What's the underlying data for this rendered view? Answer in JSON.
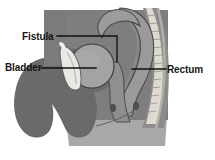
{
  "figure": {
    "background_color": "#ffffff",
    "width": 215,
    "height": 160
  },
  "labels": {
    "fistula": "Fistula",
    "bladder": "Bladder",
    "rectum": "Rectum"
  },
  "colors": {
    "tissue_mid_gray": "#7e7e7e",
    "tissue_dark_gray": "#6a6a6a",
    "tissue_light_gray": "#9e9e9e",
    "organ_fill": "#9a9a9a",
    "bladder_fill": "#a3a3a3",
    "fistula_fill": "#e8e8e4",
    "spine_light": "#dedad2",
    "spine_shadow": "#b4b0a6",
    "base_block": "#a8a8a8",
    "outline": "#3a3a3a",
    "leader_line": "#101010",
    "text": "#151515"
  },
  "structures": [
    {
      "name": "bladder",
      "description": "Rounded urinary bladder in the anterior pelvis"
    },
    {
      "name": "fistula",
      "description": "Abnormal light-colored passage anterior-inferior to the bladder"
    },
    {
      "name": "rectum",
      "description": "Curved posterior bowel segment running toward the sacrum"
    },
    {
      "name": "sacrum-spine",
      "description": "Stacked vertebral column along the posterior right margin"
    },
    {
      "name": "pelvic-soft-tissue",
      "description": "Surrounding dark gray soft tissue mass"
    }
  ],
  "leader_lines": {
    "fistula": "Elbowed leader running right from the label, then down to the bladder-rectum junction",
    "bladder": "Straight horizontal leader running right from the label into the bladder",
    "rectum": "Straight horizontal leader running left from the label into the rectal wall"
  }
}
